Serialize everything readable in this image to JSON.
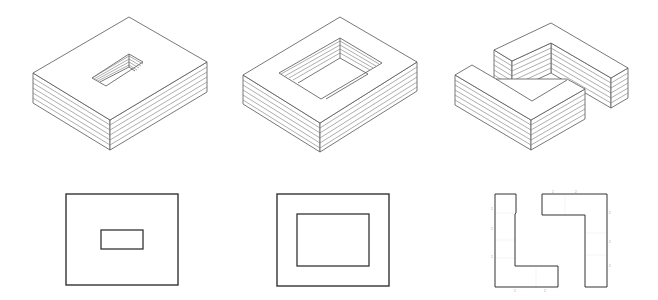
{
  "figure": {
    "stroke_color": "#555555",
    "plan_stroke_color": "#333333",
    "background": "#ffffff"
  },
  "axonometrics": [
    {
      "id": "block-small-courtyard",
      "layers": 6,
      "top": [
        [
          129,
          17
        ],
        [
          207,
          62
        ],
        [
          110,
          120
        ],
        [
          33,
          73
        ]
      ],
      "height": 30,
      "courtyard": {
        "rim": [
          [
            129,
            54
          ],
          [
            143,
            62
          ],
          [
            106,
            86
          ],
          [
            92,
            78
          ]
        ],
        "depth": 13
      }
    },
    {
      "id": "block-large-courtyard",
      "layers": 6,
      "top": [
        [
          340,
          17
        ],
        [
          417,
          62
        ],
        [
          320,
          123
        ],
        [
          243,
          75
        ]
      ],
      "height": 29,
      "courtyard": {
        "rim": [
          [
            340,
            38
          ],
          [
            382,
            63
          ],
          [
            321,
            99
          ],
          [
            279,
            73
          ]
        ],
        "depth": 20
      }
    },
    {
      "id": "block-two-l-shapes",
      "layers": 6,
      "height": 30
    }
  ],
  "plans": [
    {
      "id": "plan-small-courtyard",
      "outer": [
        66,
        194,
        112,
        91
      ],
      "inner": [
        101,
        230,
        42,
        19
      ]
    },
    {
      "id": "plan-large-courtyard",
      "outer": [
        277,
        194,
        112,
        92
      ],
      "inner": [
        297,
        214,
        72,
        52
      ]
    },
    {
      "id": "plan-two-l-shapes",
      "left_l": [
        [
          495,
          194
        ],
        [
          516,
          194
        ],
        [
          516,
          213
        ],
        [
          515,
          214
        ],
        [
          515,
          266
        ],
        [
          558,
          266
        ],
        [
          558,
          287
        ],
        [
          495,
          287
        ]
      ],
      "right_l": [
        [
          542,
          194
        ],
        [
          607,
          194
        ],
        [
          607,
          287
        ],
        [
          585,
          287
        ],
        [
          585,
          215
        ],
        [
          542,
          215
        ]
      ],
      "dimension_marks": [
        "2",
        "2",
        "2",
        "2",
        "2",
        "2",
        "2",
        "2",
        "2",
        "2"
      ]
    }
  ]
}
